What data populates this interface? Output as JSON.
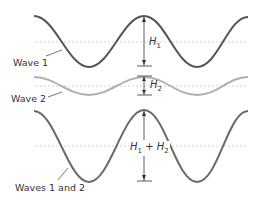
{
  "diagram": {
    "type": "wave-superposition",
    "labels": {
      "wave1": "Wave 1",
      "wave2": "Wave 2",
      "sum": "Waves 1 and 2"
    },
    "heights": {
      "h1_base": "H",
      "h1_sub": "1",
      "h2_base": "H",
      "h2_sub": "2",
      "sum_a_base": "H",
      "sum_a_sub": "1",
      "plus": " + ",
      "sum_b_base": "H",
      "sum_b_sub": "2"
    },
    "colors": {
      "wave1": "#555555",
      "wave2": "#b0b0b0",
      "sum": "#6a6a6a",
      "midline": "#c8c8c8",
      "arrow": "#333333"
    },
    "waves": [
      {
        "name": "Wave 1",
        "midline_y": 42,
        "amplitude": 25
      },
      {
        "name": "Wave 2",
        "midline_y": 86,
        "amplitude": 9
      },
      {
        "name": "Waves 1 and 2",
        "midline_y": 146,
        "amplitude": 36
      }
    ]
  }
}
